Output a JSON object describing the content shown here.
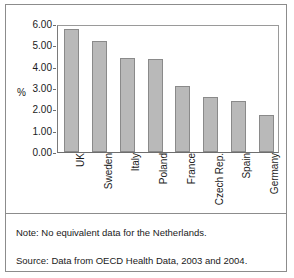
{
  "chart_data": {
    "type": "bar",
    "title": "",
    "xlabel": "",
    "ylabel": "%",
    "categories": [
      "UK",
      "Sweden",
      "Italy",
      "Poland",
      "France",
      "Czech Rep.",
      "Spain",
      "Germany"
    ],
    "values": [
      5.75,
      5.2,
      4.4,
      4.35,
      3.1,
      2.58,
      2.4,
      1.73
    ],
    "ylim": [
      0.0,
      6.0
    ],
    "ytick_labels": [
      "6.00",
      "5.00",
      "4.00",
      "3.00",
      "2.00",
      "1.00",
      "0.00"
    ],
    "ytick_values": [
      6.0,
      5.0,
      4.0,
      3.0,
      2.0,
      1.0,
      0.0
    ],
    "grid": false,
    "legend": null,
    "bar_color": "#b9b9b9",
    "bar_border_color": "#8a8a8a",
    "axis_color": "#6e6e6e"
  },
  "footnotes": {
    "note": "Note:  No equivalent data for the Netherlands.",
    "source": "Source:  Data from OECD Health Data, 2003 and 2004."
  }
}
